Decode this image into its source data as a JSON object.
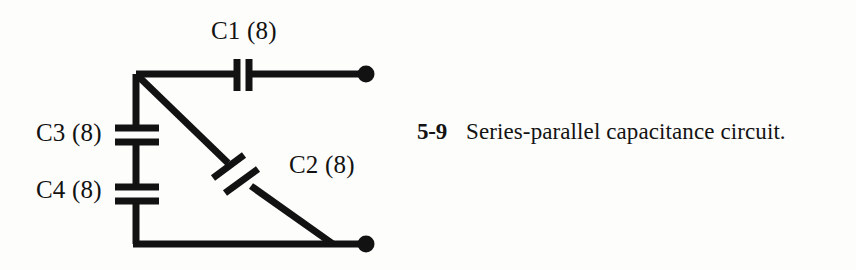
{
  "figure": {
    "number": "5-9",
    "caption": "Series-parallel capacitance circuit.",
    "kind": "schematic-diagram",
    "subject": "capacitance circuit"
  },
  "circuit": {
    "title": "Series-parallel capacitance circuit",
    "ink_color": "#121212",
    "background_color": "#fdfdfc",
    "components": [
      {
        "id": "C1",
        "label": "C1 (8)",
        "designator": "C1",
        "value": "8",
        "type": "capacitor",
        "orientation": "vertical-plates",
        "branch": "top-horizontal"
      },
      {
        "id": "C2",
        "label": "C2 (8)",
        "designator": "C2",
        "value": "8",
        "type": "capacitor",
        "orientation": "diagonal-plates",
        "branch": "diagonal"
      },
      {
        "id": "C3",
        "label": "C3 (8)",
        "designator": "C3",
        "value": "8",
        "type": "capacitor",
        "orientation": "horizontal-plates",
        "branch": "left-vertical"
      },
      {
        "id": "C4",
        "label": "C4 (8)",
        "designator": "C4",
        "value": "8",
        "type": "capacitor",
        "orientation": "horizontal-plates",
        "branch": "left-vertical"
      }
    ],
    "terminals": [
      {
        "id": "terminal-top-right",
        "name": "top-right-terminal"
      },
      {
        "id": "terminal-bottom-right",
        "name": "bottom-right-terminal"
      }
    ]
  }
}
